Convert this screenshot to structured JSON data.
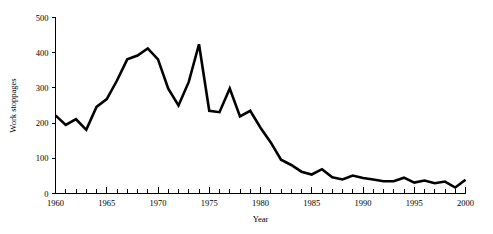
{
  "chart_data": {
    "type": "line",
    "title": "",
    "xlabel": "Year",
    "ylabel": "Work stoppages",
    "xlim": [
      1960,
      2000
    ],
    "ylim": [
      0,
      500
    ],
    "grid": false,
    "legend": null,
    "x_ticks_major": [
      1960,
      1965,
      1970,
      1975,
      1980,
      1985,
      1990,
      1995,
      2000
    ],
    "x_tick_labels": [
      "1960",
      "1965",
      "1970",
      "1975",
      "1980",
      "1985",
      "1990",
      "1995",
      "2000"
    ],
    "x_minor_tick_step": 1,
    "y_ticks": [
      0,
      100,
      200,
      300,
      400,
      500
    ],
    "y_tick_labels": [
      "0",
      "100",
      "200",
      "300",
      "400",
      "500"
    ],
    "series": [
      {
        "name": "Work stoppages",
        "color": "#000000",
        "x": [
          1960,
          1961,
          1962,
          1963,
          1964,
          1965,
          1966,
          1967,
          1968,
          1969,
          1970,
          1971,
          1972,
          1973,
          1974,
          1975,
          1976,
          1977,
          1978,
          1979,
          1980,
          1981,
          1982,
          1983,
          1984,
          1985,
          1986,
          1987,
          1988,
          1989,
          1990,
          1991,
          1992,
          1993,
          1994,
          1995,
          1996,
          1997,
          1998,
          1999,
          2000
        ],
        "values": [
          222,
          195,
          211,
          181,
          246,
          268,
          321,
          381,
          392,
          412,
          381,
          298,
          250,
          317,
          424,
          235,
          231,
          298,
          219,
          235,
          187,
          145,
          96,
          81,
          62,
          54,
          69,
          46,
          40,
          51,
          44,
          40,
          35,
          35,
          45,
          31,
          37,
          29,
          34,
          17,
          39
        ]
      }
    ]
  },
  "axis_labels": {
    "x_title": "Year",
    "y_title": "Work stoppages"
  }
}
